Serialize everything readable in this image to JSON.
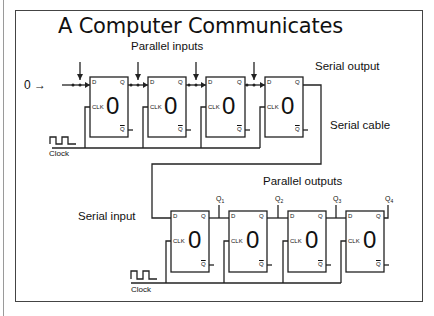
{
  "title": "A Computer Communicates",
  "labels": {
    "parallel_inputs": "Parallel inputs",
    "serial_output": "Serial output",
    "serial_cable": "Serial cable",
    "serial_input": "Serial input",
    "parallel_outputs": "Parallel outputs",
    "clock_top": "Clock",
    "clock_bottom": "Clock",
    "input_zero": "0 →"
  },
  "flipflop": {
    "d": "D",
    "clk": "CLK",
    "q": "Q",
    "qbar": "Q"
  },
  "transmitter": {
    "flipflops": [
      {
        "state": "0"
      },
      {
        "state": "0"
      },
      {
        "state": "0"
      },
      {
        "state": "0"
      }
    ]
  },
  "receiver": {
    "flipflops": [
      {
        "state": "0",
        "output": "Q1"
      },
      {
        "state": "0",
        "output": "Q2"
      },
      {
        "state": "0",
        "output": "Q3"
      },
      {
        "state": "0",
        "output": "Q4"
      }
    ],
    "outputs": [
      {
        "name": "Q",
        "sub": "1"
      },
      {
        "name": "Q",
        "sub": "2"
      },
      {
        "name": "Q",
        "sub": "3"
      },
      {
        "name": "Q",
        "sub": "4"
      }
    ]
  }
}
